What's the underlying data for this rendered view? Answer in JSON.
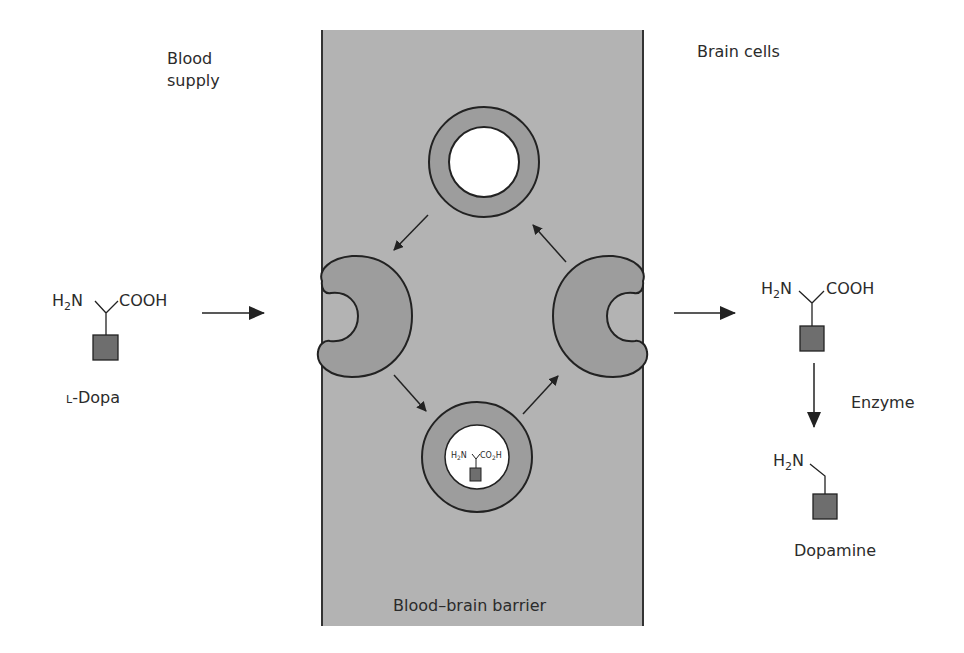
{
  "diagram": {
    "type": "biological-transport",
    "labels": {
      "blood_supply_line1": "Blood",
      "blood_supply_line2": "supply",
      "brain_cells": "Brain cells",
      "barrier": "Blood–brain barrier",
      "ldopa_prefix": "L",
      "ldopa_name": "-Dopa",
      "enzyme": "Enzyme",
      "dopamine": "Dopamine"
    },
    "molecules": {
      "ldopa": {
        "amine_h": "H",
        "amine_sub": "2",
        "amine_n": "N",
        "acid": "COOH"
      },
      "inside_brain": {
        "amine_h": "H",
        "amine_sub": "2",
        "amine_n": "N",
        "acid": "COOH"
      },
      "vesicle_cargo": {
        "amine_h": "H",
        "amine_sub": "2",
        "amine_n": "N",
        "acid_co": "CO",
        "acid_sub": "2",
        "acid_h": "H"
      },
      "dopamine": {
        "amine_h": "H",
        "amine_sub": "2",
        "amine_n": "N"
      }
    },
    "colors": {
      "barrier_fill": "#b3b3b3",
      "carrier_fill": "#9d9d9d",
      "side_chain_fill": "#6e6e6e",
      "outline": "#222222",
      "text": "#2b2b2b"
    },
    "nodes": [
      {
        "id": "ldopa",
        "label": "L-Dopa",
        "region": "blood supply"
      },
      {
        "id": "carrier-left",
        "label": "transport protein (blood side)",
        "region": "barrier"
      },
      {
        "id": "vesicle-loaded",
        "label": "carrier with L-Dopa",
        "region": "barrier"
      },
      {
        "id": "carrier-right",
        "label": "transport protein (brain side)",
        "region": "barrier"
      },
      {
        "id": "vesicle-empty",
        "label": "empty carrier",
        "region": "barrier"
      },
      {
        "id": "ldopa-brain",
        "label": "L-Dopa in brain",
        "region": "brain cells"
      },
      {
        "id": "dopamine",
        "label": "Dopamine",
        "region": "brain cells"
      }
    ],
    "edges": [
      {
        "from": "ldopa",
        "to": "carrier-left"
      },
      {
        "from": "carrier-left",
        "to": "vesicle-loaded"
      },
      {
        "from": "vesicle-loaded",
        "to": "carrier-right"
      },
      {
        "from": "carrier-right",
        "to": "vesicle-empty"
      },
      {
        "from": "vesicle-empty",
        "to": "carrier-left"
      },
      {
        "from": "carrier-right",
        "to": "ldopa-brain"
      },
      {
        "from": "ldopa-brain",
        "to": "dopamine",
        "label": "Enzyme"
      }
    ]
  }
}
